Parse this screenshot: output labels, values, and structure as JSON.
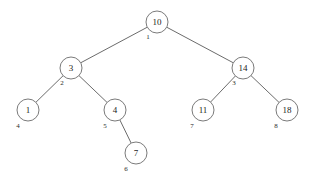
{
  "figure": {
    "type": "binary-search-tree-diagram",
    "background_color": "#ffffff",
    "node_fill_color": "#ffffff",
    "node_stroke_color": "#6b6b6b",
    "edge_color": "#5a5a5a",
    "text_color": "#1a1a1a",
    "width": 312,
    "height": 184
  },
  "chart_data": {
    "type": "diagram",
    "title": "",
    "nodes": [
      {
        "id": "n1",
        "value": "10",
        "index_label": "1",
        "cx": 157,
        "cy": 22,
        "r": 11,
        "index_dx": -9,
        "index_dy": 15,
        "depth": 0
      },
      {
        "id": "n2",
        "value": "3",
        "index_label": "2",
        "cx": 71,
        "cy": 68,
        "r": 11,
        "index_dx": -9,
        "index_dy": 15,
        "depth": 1
      },
      {
        "id": "n3",
        "value": "14",
        "index_label": "3",
        "cx": 243,
        "cy": 68,
        "r": 11,
        "index_dx": -9,
        "index_dy": 15,
        "depth": 1
      },
      {
        "id": "n4",
        "value": "1",
        "index_label": "4",
        "cx": 28,
        "cy": 110,
        "r": 11,
        "index_dx": -10,
        "index_dy": 16,
        "depth": 2
      },
      {
        "id": "n5",
        "value": "4",
        "index_label": "5",
        "cx": 115,
        "cy": 110,
        "r": 11,
        "index_dx": -10,
        "index_dy": 16,
        "depth": 2
      },
      {
        "id": "n6",
        "value": "11",
        "index_label": "7",
        "cx": 203,
        "cy": 110,
        "r": 11,
        "index_dx": -11,
        "index_dy": 16,
        "depth": 2
      },
      {
        "id": "n7",
        "value": "18",
        "index_label": "8",
        "cx": 287,
        "cy": 110,
        "r": 11,
        "index_dx": -11,
        "index_dy": 16,
        "depth": 2
      },
      {
        "id": "n8",
        "value": "7",
        "index_label": "6",
        "cx": 136,
        "cy": 153,
        "r": 11,
        "index_dx": -10,
        "index_dy": 16,
        "depth": 3
      }
    ],
    "edges": [
      {
        "from": "n1",
        "to": "n2",
        "side": "left"
      },
      {
        "from": "n1",
        "to": "n3",
        "side": "right"
      },
      {
        "from": "n2",
        "to": "n4",
        "side": "left"
      },
      {
        "from": "n2",
        "to": "n5",
        "side": "right"
      },
      {
        "from": "n5",
        "to": "n8",
        "side": "right"
      },
      {
        "from": "n3",
        "to": "n6",
        "side": "left"
      },
      {
        "from": "n3",
        "to": "n7",
        "side": "right"
      }
    ]
  }
}
